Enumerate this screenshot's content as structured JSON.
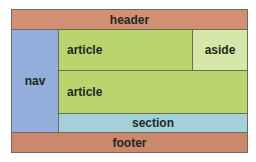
{
  "diagram": {
    "regions": {
      "header": {
        "label": "header",
        "color": "#d38f73"
      },
      "nav": {
        "label": "nav",
        "color": "#93aedb"
      },
      "article1": {
        "label": "article",
        "color": "#b9d56d"
      },
      "aside": {
        "label": "aside",
        "color": "#d6e8a9"
      },
      "article2": {
        "label": "article",
        "color": "#b9d56d"
      },
      "section": {
        "label": "section",
        "color": "#a4d1d9"
      },
      "footer": {
        "label": "footer",
        "color": "#cd876c"
      }
    }
  }
}
